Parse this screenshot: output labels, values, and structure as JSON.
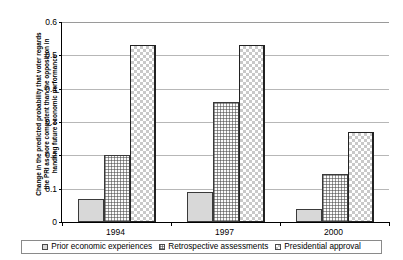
{
  "chart_data": {
    "type": "bar",
    "title": "",
    "xlabel": "",
    "ylabel": "Change in the predicted probability that voter regards the PRI as more competent than the opposition in handling future economic performance",
    "ylabel_lines": [
      "Change in the predicted probability that voter regards",
      "the PRI as more competent than the opposition in",
      "handling future economic performance"
    ],
    "categories": [
      "1994",
      "1997",
      "2000"
    ],
    "series": [
      {
        "name": "Prior economic experiences",
        "values": [
          0.07,
          0.09,
          0.04
        ]
      },
      {
        "name": "Retrospective assessments",
        "values": [
          0.2,
          0.36,
          0.145
        ]
      },
      {
        "name": "Presidential approval",
        "values": [
          0.53,
          0.53,
          0.27
        ]
      }
    ],
    "ylim": [
      0,
      0.6
    ],
    "yticks": [
      0,
      0.1,
      0.2,
      0.3,
      0.4,
      0.5,
      0.6
    ],
    "ytick_labels": [
      "0",
      "0.1",
      "0.2",
      "0.3",
      "0.4",
      "0.5",
      "0.6"
    ],
    "grid": "horizontal",
    "legend_position": "bottom",
    "colors": {
      "series_0_fill": "#d8d8d8",
      "series_1_fill": "#fbfbfb",
      "series_2_fill": "#ffffff",
      "bar_border": "#3a3a3a",
      "gridline": "#b7b7b7",
      "axis": "#000000",
      "background": "#ffffff"
    }
  }
}
